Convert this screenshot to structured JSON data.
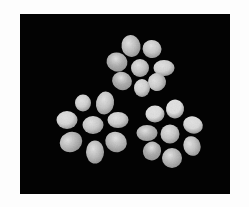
{
  "image": {
    "description": "Three gray daisy-like flowers with oval petals on a black background, framed by a white border",
    "canvas": {
      "width": 249,
      "height": 207,
      "border_color": "#fdfdfd"
    },
    "background_rect": {
      "x": 20,
      "y": 14,
      "width": 210,
      "height": 180,
      "color": "#030303"
    },
    "gradient": {
      "light": "#e2e2e2",
      "mid": "#bdbdbd",
      "dark": "#8e8e8e"
    },
    "flowers": [
      {
        "name": "flower-top",
        "center": {
          "cx": 140,
          "cy": 68,
          "rx": 9,
          "ry": 9,
          "shade": "#c4c4c4"
        },
        "petals": [
          {
            "cx": 131,
            "cy": 46,
            "rx": 9.5,
            "ry": 11,
            "rot": -10,
            "shade": "#bcbcbc"
          },
          {
            "cx": 152,
            "cy": 49,
            "rx": 9.5,
            "ry": 9,
            "rot": 20,
            "shade": "#c6c6c6"
          },
          {
            "cx": 164,
            "cy": 68,
            "rx": 10.5,
            "ry": 8,
            "rot": 0,
            "shade": "#d2d2d2"
          },
          {
            "cx": 157,
            "cy": 82,
            "rx": 9,
            "ry": 9,
            "rot": -30,
            "shade": "#cacaca"
          },
          {
            "cx": 142,
            "cy": 88,
            "rx": 8,
            "ry": 9,
            "rot": 0,
            "shade": "#d0d0d0"
          },
          {
            "cx": 122,
            "cy": 81,
            "rx": 10,
            "ry": 9,
            "rot": 20,
            "shade": "#a9a9a9"
          },
          {
            "cx": 117,
            "cy": 62,
            "rx": 10.5,
            "ry": 9.5,
            "rot": 15,
            "shade": "#ababab"
          }
        ]
      },
      {
        "name": "flower-bottom-left",
        "center": {
          "cx": 93,
          "cy": 125,
          "rx": 10.5,
          "ry": 9,
          "shade": "#c8c8c8"
        },
        "petals": [
          {
            "cx": 83,
            "cy": 103,
            "rx": 8,
            "ry": 8.5,
            "rot": 0,
            "shade": "#cfcfcf"
          },
          {
            "cx": 105,
            "cy": 103,
            "rx": 9,
            "ry": 11.5,
            "rot": 10,
            "shade": "#c4c4c4"
          },
          {
            "cx": 118,
            "cy": 120,
            "rx": 10.5,
            "ry": 8,
            "rot": 0,
            "shade": "#cdcdcd"
          },
          {
            "cx": 116,
            "cy": 142,
            "rx": 11,
            "ry": 10,
            "rot": 30,
            "shade": "#b7b7b7"
          },
          {
            "cx": 95,
            "cy": 152,
            "rx": 9,
            "ry": 11.5,
            "rot": 0,
            "shade": "#bababa"
          },
          {
            "cx": 71,
            "cy": 142,
            "rx": 11.5,
            "ry": 10,
            "rot": -25,
            "shade": "#b4b4b4"
          },
          {
            "cx": 67,
            "cy": 120,
            "rx": 10.5,
            "ry": 9,
            "rot": 0,
            "shade": "#d5d5d5"
          }
        ]
      },
      {
        "name": "flower-bottom-right",
        "center": {
          "cx": 170,
          "cy": 134,
          "rx": 9.5,
          "ry": 9.5,
          "shade": "#c6c6c6"
        },
        "petals": [
          {
            "cx": 155,
            "cy": 114,
            "rx": 9.5,
            "ry": 8.5,
            "rot": 0,
            "shade": "#dddddd"
          },
          {
            "cx": 175,
            "cy": 109,
            "rx": 9,
            "ry": 9.5,
            "rot": 10,
            "shade": "#e0e0e0"
          },
          {
            "cx": 193,
            "cy": 125,
            "rx": 10,
            "ry": 8.5,
            "rot": 20,
            "shade": "#dadada"
          },
          {
            "cx": 192,
            "cy": 146,
            "rx": 8.5,
            "ry": 10,
            "rot": -20,
            "shade": "#c0c0c0"
          },
          {
            "cx": 172,
            "cy": 158,
            "rx": 10,
            "ry": 10,
            "rot": 0,
            "shade": "#b4b4b4"
          },
          {
            "cx": 152,
            "cy": 151,
            "rx": 9,
            "ry": 9.5,
            "rot": 25,
            "shade": "#a7a7a7"
          },
          {
            "cx": 147,
            "cy": 133,
            "rx": 10.5,
            "ry": 8,
            "rot": 0,
            "shade": "#b1b1b1"
          }
        ]
      }
    ]
  }
}
